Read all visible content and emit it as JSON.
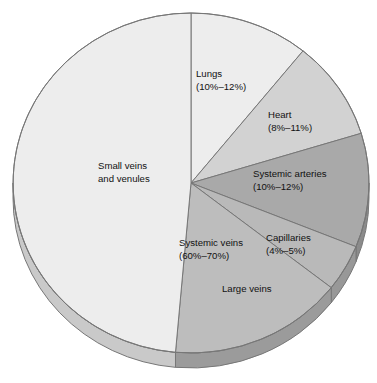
{
  "chart_data": {
    "type": "pie",
    "title": "",
    "subtitle": "",
    "xlabel": "",
    "ylabel": "",
    "legend_position": "none",
    "grid": false,
    "style": "3d-pie-greyscale",
    "units": "percent of total blood volume",
    "start_angle_deg": 0,
    "direction": "clockwise",
    "categories": [
      "Lungs",
      "Heart",
      "Systemic arteries",
      "Capillaries",
      "Large veins",
      "Small veins and venules"
    ],
    "values": [
      11,
      9.5,
      11,
      4.5,
      16,
      48
    ],
    "slices": [
      {
        "name": "Lungs",
        "label_line1": "Lungs",
        "label_line2": "(10%–12%)",
        "range_low": 10,
        "range_high": 12,
        "value": 11,
        "color": "#ededed",
        "side_color": "#c9c9c9",
        "start_deg": 0,
        "end_deg": 39,
        "label_x": 196,
        "label_y": 77
      },
      {
        "name": "Heart",
        "label_line1": "Heart",
        "label_line2": "(8%–11%)",
        "range_low": 8,
        "range_high": 11,
        "value": 9.5,
        "color": "#d2d2d2",
        "side_color": "#b0b0b0",
        "start_deg": 39,
        "end_deg": 73,
        "label_x": 268,
        "label_y": 118
      },
      {
        "name": "Systemic arteries",
        "label_line1": "Systemic arteries",
        "label_line2": "(10%–12%)",
        "range_low": 10,
        "range_high": 12,
        "value": 11,
        "color": "#a9a9a9",
        "side_color": "#8b8b8b",
        "start_deg": 73,
        "end_deg": 112,
        "label_x": 253,
        "label_y": 177
      },
      {
        "name": "Capillaries",
        "label_line1": "Capillaries",
        "label_line2": "(4%–5%)",
        "range_low": 4,
        "range_high": 5,
        "value": 4.5,
        "color": "#b9b9b9",
        "side_color": "#989898",
        "start_deg": 112,
        "end_deg": 128,
        "label_x": 266,
        "label_y": 241
      },
      {
        "name": "Large veins",
        "label_line1": "Large veins",
        "label_line2": "",
        "range_low": null,
        "range_high": null,
        "value": 16,
        "color": "#bdbdbd",
        "side_color": "#9b9b9b",
        "start_deg": 128,
        "end_deg": 185,
        "label_x": 222,
        "label_y": 292
      },
      {
        "name": "Small veins and venules",
        "label_line1": "Small veins",
        "label_line2": "and venules",
        "range_low": null,
        "range_high": null,
        "value": 48,
        "color": "#ededed",
        "side_color": "#c9c9c9",
        "start_deg": 185,
        "end_deg": 360,
        "label_x": 98,
        "label_y": 169
      }
    ],
    "group_annotations": [
      {
        "name": "Systemic veins",
        "label_line1": "Systemic veins",
        "label_line2": "(60%–70%)",
        "range_low": 60,
        "range_high": 70,
        "covers": [
          "Large veins",
          "Small veins and venules"
        ],
        "label_x": 179,
        "label_y": 246
      }
    ],
    "geometry": {
      "center_x": 191,
      "center_y": 183,
      "radius_x": 178,
      "radius_y": 170,
      "depth": 15,
      "outline_color": "#777777"
    }
  }
}
